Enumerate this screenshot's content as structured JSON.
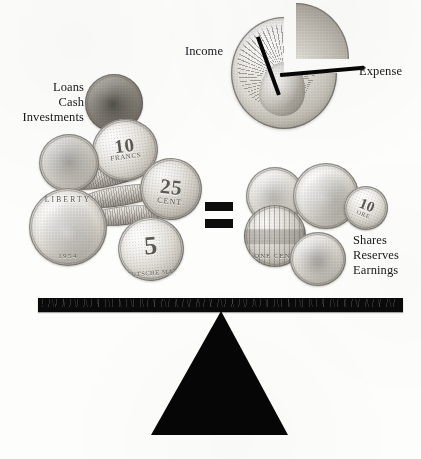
{
  "figure": {
    "kind": "balance-scale-diagram",
    "background_color": "#fdfdfc",
    "ink_color": "#17161a",
    "solid_black": "#0a0a0a"
  },
  "pie": {
    "title": "",
    "income_label": "Income",
    "expense_label": "Expense",
    "coin_caption": "",
    "note": ""
  },
  "left_pan": {
    "labels": [
      "Loans",
      "Cash",
      "Investments"
    ],
    "coins": [
      {
        "name": "dark-coin-top",
        "text": ""
      },
      {
        "name": "ten-francs-coin",
        "text": "10",
        "sub": "FRANCS"
      },
      {
        "name": "twenty-five-cent-coin",
        "text": "25",
        "sub": "CENT",
        "year": "1951"
      },
      {
        "name": "washington-quarter",
        "text": "LIBERTY",
        "year": "1954"
      },
      {
        "name": "five-mark-coin",
        "text": "5",
        "sub": "DEUTSCHE MARK"
      },
      {
        "name": "small-worn-coin",
        "text": ""
      }
    ]
  },
  "operator": {
    "symbol": "=",
    "name": "equals-sign"
  },
  "right_pan": {
    "labels": [
      "Shares",
      "Reserves",
      "Earnings"
    ],
    "coins": [
      {
        "name": "jefferson-nickel",
        "text": ""
      },
      {
        "name": "liberty-head-coin",
        "text": ""
      },
      {
        "name": "lincoln-memorial-penny",
        "text": "ONE CENT"
      },
      {
        "name": "ten-ore-coin",
        "text": "10",
        "sub": "ORE"
      },
      {
        "name": "worn-coin-bottom",
        "text": ""
      }
    ]
  },
  "scale": {
    "beam_name": "balance-beam",
    "fulcrum_name": "fulcrum-triangle"
  }
}
